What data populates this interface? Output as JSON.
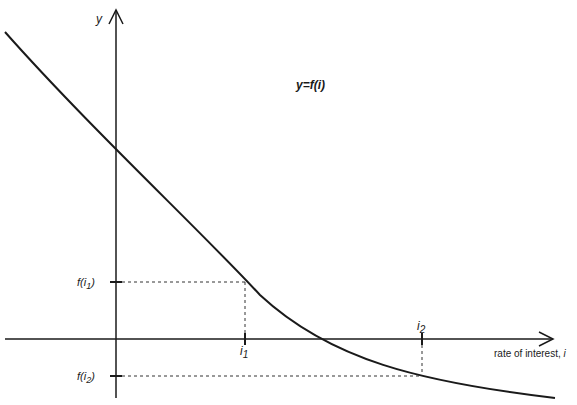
{
  "diagram": {
    "type": "function-curve",
    "function_label": "y=f(i)",
    "y_axis": {
      "label": "y"
    },
    "x_axis": {
      "label": "rate of interest, ",
      "label_var": "i"
    },
    "points": [
      {
        "x_label": "i",
        "x_sub": "1",
        "y_label": "f(i",
        "y_sub": "1",
        "y_close": ")"
      },
      {
        "x_label": "i",
        "x_sub": "2",
        "y_label": "f(i",
        "y_sub": "2",
        "y_close": ")"
      }
    ],
    "colors": {
      "line": "#1a1a1a",
      "background": "#ffffff"
    }
  }
}
